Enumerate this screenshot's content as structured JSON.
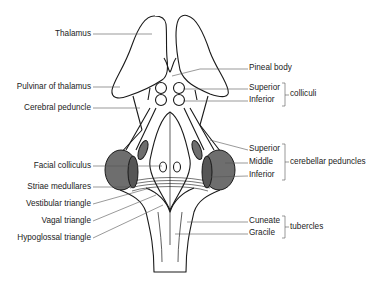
{
  "left_labels": [
    {
      "id": "thalamus",
      "text": "Thalamus"
    },
    {
      "id": "pulvinar",
      "text": "Pulvinar of thalamus"
    },
    {
      "id": "cerebral-peduncle",
      "text": "Cerebral peduncle"
    },
    {
      "id": "facial-colliculus",
      "text": "Facial colliculus"
    },
    {
      "id": "striae-medullares",
      "text": "Striae medullares"
    },
    {
      "id": "vestibular-triangle",
      "text": "Vestibular triangle"
    },
    {
      "id": "vagal-triangle",
      "text": "Vagal triangle"
    },
    {
      "id": "hypoglossal-triangle",
      "text": "Hypoglossal triangle"
    }
  ],
  "right_labels": {
    "pineal": "Pineal body",
    "colliculi": {
      "group": "colliculi",
      "items": [
        "Superior",
        "Inferior"
      ]
    },
    "cerebellar_peduncles": {
      "group": "cerebellar peduncles",
      "items": [
        "Superior",
        "Middle",
        "Inferior"
      ]
    },
    "tubercles": {
      "group": "tubercles",
      "items": [
        "Cuneate",
        "Gracile"
      ]
    }
  },
  "colors": {
    "line": "#1a1a1a",
    "leader": "#555555",
    "shade": "#6e6e6e",
    "shade_dark": "#555555"
  }
}
